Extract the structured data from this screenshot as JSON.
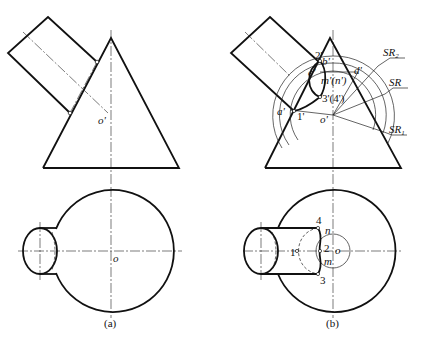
{
  "figure": {
    "panels": [
      {
        "caption": "(a)",
        "front_view_labels": {
          "center": "o'"
        },
        "top_view_labels": {
          "center": "o"
        }
      },
      {
        "caption": "(b)",
        "front_view_labels": {
          "center": "o'",
          "a": "a'",
          "c": "c'",
          "b": "b'",
          "d": "d'",
          "p1": "1'",
          "p2": "2'",
          "p34": "3'(4')",
          "mn": "m'(n')",
          "sr": "SR",
          "sr1": "SR",
          "sr1_sub": "1",
          "sr2": "SR",
          "sr2_sub": "2"
        },
        "top_view_labels": {
          "center": "o",
          "p1": "1",
          "p2": "2",
          "p3": "3",
          "p4": "4",
          "m": "m",
          "n": "n"
        }
      }
    ]
  }
}
